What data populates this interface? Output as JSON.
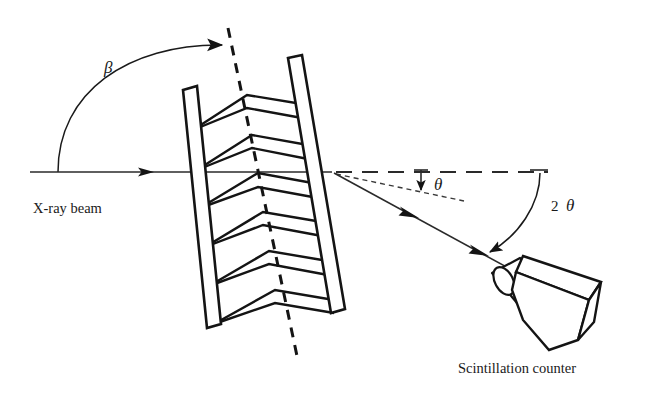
{
  "figure": {
    "background_color": "#ffffff",
    "ink_color": "#141414",
    "width": 668,
    "height": 401
  },
  "labels": {
    "incident_beam": "X-ray beam",
    "detector": "Scintillation counter",
    "beta_angle": "β",
    "theta_angle": "θ",
    "two_theta_number": "2",
    "two_theta_symbol": "θ"
  },
  "annotations": {
    "beta_description": "Rotation angle of specimen normal from incident beam direction",
    "theta_description": "Bragg angle between diffracted beam and horizontal reference",
    "two_theta_description": "Detector angle, twice the Bragg angle"
  },
  "geometry": {
    "incident_beam": {
      "from_x": 30,
      "from_y": 172,
      "to_x": 330,
      "to_y": 172,
      "arrowhead_x": 148,
      "arrowhead_y": 172
    },
    "diffracted_beam": {
      "from_x": 333,
      "from_y": 172,
      "to_x": 505,
      "to_y": 266,
      "arrowhead_1_x": 413,
      "arrowhead_1_y": 216,
      "arrowhead_2_x": 482,
      "arrowhead_2_y": 254
    },
    "horizontal_reference": {
      "from_x": 335,
      "from_y": 172,
      "to_x": 548,
      "to_y": 172
    },
    "dotted_ray": {
      "from_x": 335,
      "from_y": 174,
      "to_x": 462,
      "to_y": 200
    },
    "specimen_normal": {
      "from_x": 228,
      "from_y": 28,
      "to_x": 296,
      "to_y": 356
    },
    "left_rail": {
      "top_x": 186,
      "top_y": 88,
      "bottom_x": 208,
      "bottom_y": 322,
      "width": 14
    },
    "right_rail": {
      "top_x": 289,
      "top_y": 57,
      "bottom_x": 332,
      "bottom_y": 312,
      "width": 14
    },
    "rung_count": 6,
    "beta_arc": {
      "start_x": 58,
      "start_y": 172,
      "end_x": 232,
      "end_y": 47
    },
    "two_theta_arc": {
      "start_x": 545,
      "start_y": 174,
      "end_x": 481,
      "end_y": 255
    }
  },
  "counter": {
    "tube_label": "collimator-tube",
    "body_label": "detector-housing",
    "center_x": 540,
    "center_y": 300,
    "tilt_degrees": 30
  }
}
